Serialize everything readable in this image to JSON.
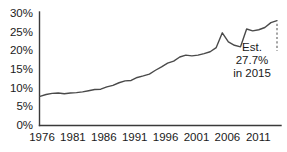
{
  "chart_data": {
    "type": "line",
    "title": "",
    "subtitle": "",
    "xlabel": "",
    "ylabel": "",
    "xlim": [
      1976,
      2015
    ],
    "ylim": [
      0,
      30
    ],
    "grid": false,
    "legend": "none",
    "y_tick_labels": [
      "30%",
      "25%",
      "20%",
      "15%",
      "10%",
      "5%",
      "0%"
    ],
    "y_tick_values": [
      30,
      25,
      20,
      15,
      10,
      5,
      0
    ],
    "x_tick_labels": [
      "1976",
      "1981",
      "1986",
      "1991",
      "1996",
      "2001",
      "2006",
      "2011"
    ],
    "x_tick_values": [
      1976,
      1981,
      1986,
      1991,
      1996,
      2001,
      2006,
      2011
    ],
    "series": [
      {
        "name": "Share",
        "x": [
          1976,
          1977,
          1978,
          1979,
          1980,
          1981,
          1982,
          1983,
          1984,
          1985,
          1986,
          1987,
          1988,
          1989,
          1990,
          1991,
          1992,
          1993,
          1994,
          1995,
          1996,
          1997,
          1998,
          1999,
          2000,
          2001,
          2002,
          2003,
          2004,
          2005,
          2006,
          2007,
          2008,
          2009,
          2010,
          2011,
          2012,
          2013,
          2014,
          2015
        ],
        "values": [
          7.7,
          8.2,
          8.5,
          8.6,
          8.4,
          8.6,
          8.7,
          8.9,
          9.2,
          9.5,
          9.6,
          10.2,
          10.6,
          11.3,
          11.8,
          11.9,
          12.7,
          13.1,
          13.6,
          14.6,
          15.5,
          16.5,
          17.0,
          18.1,
          18.6,
          18.4,
          18.6,
          19.0,
          19.5,
          20.6,
          24.5,
          22.1,
          21.2,
          20.8,
          25.5,
          25.0,
          25.3,
          25.9,
          27.2,
          27.7
        ],
        "style": "solid",
        "color": "#4a4a4a"
      }
    ],
    "annotations": [
      {
        "name": "estimate-callout",
        "lines": [
          "Est.",
          "27.7%",
          "in 2015"
        ],
        "value": 27.7,
        "year": 2015
      }
    ],
    "projection_marker": {
      "name": "projection-dashed-marker",
      "style": "dashed",
      "year": 2015
    }
  }
}
